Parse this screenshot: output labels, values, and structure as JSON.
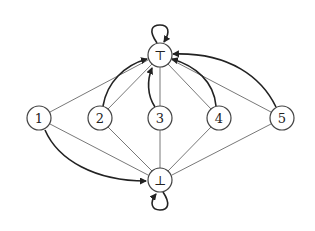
{
  "diagram": {
    "type": "directed-graph",
    "nodes": [
      {
        "id": "top",
        "label": "⊤",
        "x": 160,
        "y": 55
      },
      {
        "id": "bot",
        "label": "⊥",
        "x": 160,
        "y": 180
      },
      {
        "id": "n1",
        "label": "1",
        "x": 39,
        "y": 118
      },
      {
        "id": "n2",
        "label": "2",
        "x": 100,
        "y": 118
      },
      {
        "id": "n3",
        "label": "3",
        "x": 160,
        "y": 118
      },
      {
        "id": "n4",
        "label": "4",
        "x": 219,
        "y": 118
      },
      {
        "id": "n5",
        "label": "5",
        "x": 282,
        "y": 118
      }
    ],
    "thin_edges": [
      {
        "from": "n1",
        "to": "top"
      },
      {
        "from": "n2",
        "to": "top"
      },
      {
        "from": "n3",
        "to": "top"
      },
      {
        "from": "n4",
        "to": "top"
      },
      {
        "from": "n5",
        "to": "top"
      },
      {
        "from": "n1",
        "to": "bot"
      },
      {
        "from": "n2",
        "to": "bot"
      },
      {
        "from": "n3",
        "to": "bot"
      },
      {
        "from": "n4",
        "to": "bot"
      },
      {
        "from": "n5",
        "to": "bot"
      }
    ],
    "arrow_edges": [
      {
        "from": "n2",
        "to": "top",
        "curve": "left"
      },
      {
        "from": "n3",
        "to": "top",
        "curve": "left"
      },
      {
        "from": "n4",
        "to": "top",
        "curve": "right"
      },
      {
        "from": "n5",
        "to": "top",
        "curve": "right"
      },
      {
        "from": "n1",
        "to": "bot",
        "curve": "below"
      }
    ],
    "self_loops": [
      {
        "node": "top",
        "position": "above"
      },
      {
        "node": "bot",
        "position": "below"
      }
    ],
    "node_radius": 12
  }
}
